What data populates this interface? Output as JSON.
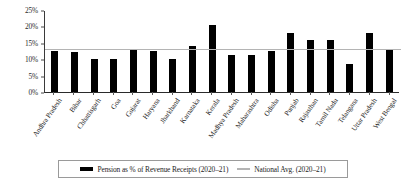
{
  "chart_data": {
    "type": "bar",
    "title": "",
    "xlabel": "",
    "ylabel": "",
    "ylim": [
      0,
      25
    ],
    "ytick_labels": [
      "25%",
      "20%",
      "15%",
      "10%",
      "5%",
      "0%"
    ],
    "ytick_values": [
      25,
      20,
      15,
      10,
      5,
      0
    ],
    "grid": false,
    "legend_position": "bottom",
    "categories": [
      "Andhra Pradesh",
      "Bihar",
      "Chhattisgarh",
      "Goa",
      "Gujarat",
      "Haryana",
      "Jharkhand",
      "Karnataka",
      "Kerala",
      "Madhya Pradesh",
      "Maharashtra",
      "Odisha",
      "Punjab",
      "Rajasthan",
      "Tamil Nadu",
      "Telangana",
      "Uttar Pradesh",
      "West Bengal"
    ],
    "series": [
      {
        "name": "Pension as % of Revenue Receipts (2020–21)",
        "type": "bar",
        "color": "#000000",
        "values": [
          12.3,
          11.9,
          9.9,
          10.0,
          12.6,
          12.3,
          9.9,
          14.0,
          20.4,
          11.0,
          11.0,
          12.3,
          17.9,
          15.6,
          15.6,
          8.3,
          17.9,
          12.9
        ]
      },
      {
        "name": "National Avg. (2020–21)",
        "type": "line",
        "color": "#b4b4b4",
        "value": 13.5
      }
    ]
  },
  "legend": {
    "bar_label": "Pension as % of Revenue Receipts (2020–21)",
    "line_label": "National Avg. (2020–21)"
  }
}
